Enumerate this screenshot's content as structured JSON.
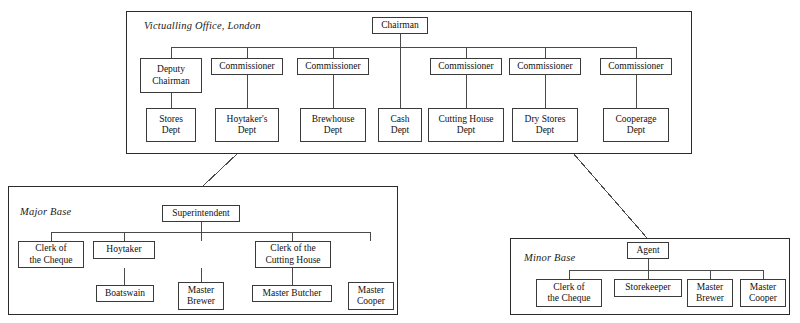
{
  "diagram": {
    "type": "organization-chart",
    "caption": "Royal Navy Victualling organisation: Victualling Office London, Major Base and Minor Base"
  },
  "panels": {
    "head_office": {
      "title": "Victualling Office, London",
      "root": {
        "label": "Chairman"
      },
      "officers": [
        {
          "label": "Deputy\nChairman"
        },
        {
          "label": "Commissioner"
        },
        {
          "label": "Commissioner"
        },
        {
          "label": "Commissioner"
        },
        {
          "label": "Commissioner"
        },
        {
          "label": "Commissioner"
        }
      ],
      "departments": [
        {
          "label": "Stores\nDept"
        },
        {
          "label": "Hoytaker's\nDept"
        },
        {
          "label": "Brewhouse\nDept"
        },
        {
          "label": "Cash\nDept"
        },
        {
          "label": "Cutting House\nDept"
        },
        {
          "label": "Dry Stores\nDept"
        },
        {
          "label": "Cooperage\nDept"
        }
      ]
    },
    "major_base": {
      "title": "Major Base",
      "root": {
        "label": "Superintendent"
      },
      "officers": [
        {
          "label": "Clerk of\nthe Cheque"
        },
        {
          "label": "Hoytaker"
        },
        {
          "label": "Clerk of the\nBrewhouse"
        },
        {
          "label": "Clerk of the\nCutting House"
        },
        {
          "label": "Master\nCooper"
        }
      ],
      "subordinates": [
        {
          "label": "Boatswain"
        },
        {
          "label": "Master\nBrewer"
        },
        {
          "label": "Master Butcher"
        }
      ]
    },
    "minor_base": {
      "title": "Minor Base",
      "root": {
        "label": "Agent"
      },
      "officers": [
        {
          "label": "Clerk of\nthe Cheque"
        },
        {
          "label": "Storekeeper"
        },
        {
          "label": "Master\nBrewer"
        },
        {
          "label": "Master\nCooper"
        }
      ]
    }
  },
  "colors": {
    "panel_border": "#2b2b2b",
    "node_border": "#3a3a3a",
    "wire": "#4a4a4a",
    "text": "#111111",
    "background": "#ffffff"
  }
}
